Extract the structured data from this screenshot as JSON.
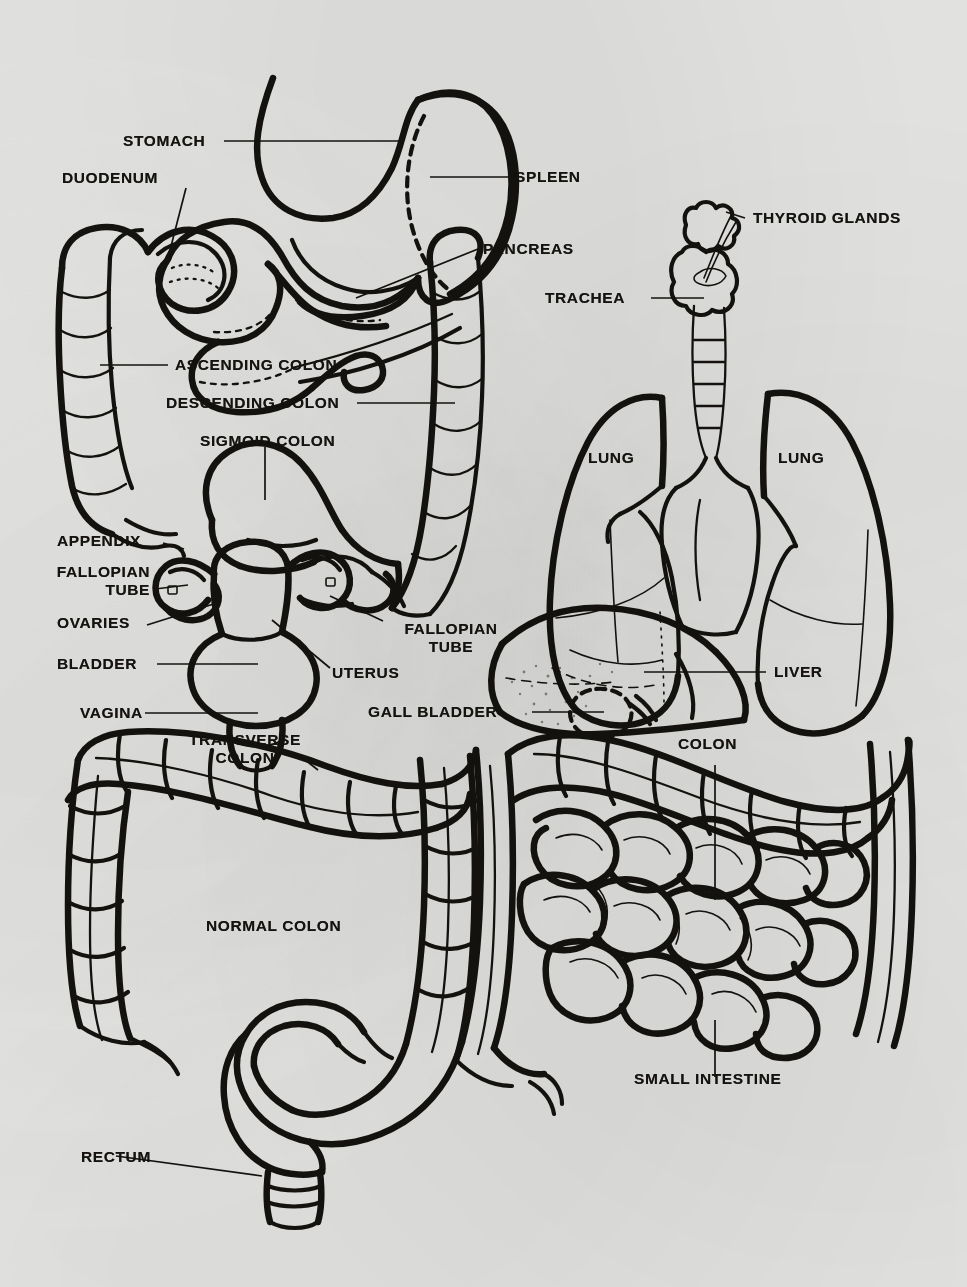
{
  "document": {
    "title": "Human Internal Organs Anatomical Diagram",
    "background_color": "#e9e9e7",
    "ink_color": "#15130f",
    "style": "black-and-white line drawing, photocopied page"
  },
  "panels": [
    {
      "id": "upper-left",
      "name": "Abdominal organs with colon, stomach and female reproductive organs"
    },
    {
      "id": "upper-right",
      "name": "Thyroid, trachea, lungs and liver"
    },
    {
      "id": "lower-left",
      "name": "Normal colon"
    },
    {
      "id": "lower-right",
      "name": "Colon and small intestine"
    }
  ],
  "labels": {
    "stomach": "STOMACH",
    "duodenum": "DUODENUM",
    "spleen": "SPLEEN",
    "pancreas": "PANCREAS",
    "ascending_colon": "ASCENDING COLON",
    "descending_colon": "DESCENDING COLON",
    "sigmoid_colon": "SIGMOID COLON",
    "appendix": "APPENDIX",
    "fallopian_tube_left": "FALLOPIAN\nTUBE",
    "fallopian_tube_right": "FALLOPIAN\nTUBE",
    "ovaries": "OVARIES",
    "bladder": "BLADDER",
    "uterus": "UTERUS",
    "vagina": "VAGINA",
    "thyroid_glands": "THYROID GLANDS",
    "trachea": "TRACHEA",
    "lung_left": "LUNG",
    "lung_right": "LUNG",
    "liver": "LIVER",
    "gall_bladder": "GALL BLADDER",
    "colon": "COLON",
    "transverse_colon": "TRANSVERSE\nCOLON",
    "normal_colon": "NORMAL COLON",
    "rectum": "RECTUM",
    "small_intestine": "SMALL INTESTINE"
  }
}
